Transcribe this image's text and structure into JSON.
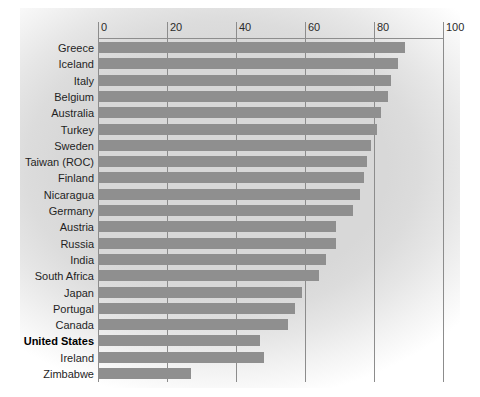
{
  "chart_data": {
    "type": "bar",
    "orientation": "horizontal",
    "title": "",
    "xlabel": "",
    "ylabel": "",
    "xlim": [
      0,
      100
    ],
    "grid": true,
    "legend": null,
    "tick_labels": [
      "0",
      "20",
      "40",
      "60",
      "80",
      "100"
    ],
    "ticks": [
      0,
      20,
      40,
      60,
      80,
      100
    ],
    "categories": [
      "Greece",
      "Iceland",
      "Italy",
      "Belgium",
      "Australia",
      "Turkey",
      "Sweden",
      "Taiwan (ROC)",
      "Finland",
      "Nicaragua",
      "Germany",
      "Austria",
      "Russia",
      "India",
      "South Africa",
      "Japan",
      "Portugal",
      "Canada",
      "United States",
      "Ireland",
      "Zimbabwe"
    ],
    "values": [
      89,
      87,
      85,
      84,
      82,
      81,
      79,
      78,
      77,
      76,
      74,
      69,
      69,
      66,
      64,
      59,
      57,
      55,
      47,
      48,
      27
    ],
    "highlight_category": "United States",
    "bar_color": "#8f8f8f",
    "gridline_color": "#8c8c8c",
    "background_color": "#d8d8d8"
  },
  "rows": [
    {
      "label": "Greece",
      "value": 89,
      "bold": false
    },
    {
      "label": "Iceland",
      "value": 87,
      "bold": false
    },
    {
      "label": "Italy",
      "value": 85,
      "bold": false
    },
    {
      "label": "Belgium",
      "value": 84,
      "bold": false
    },
    {
      "label": "Australia",
      "value": 82,
      "bold": false
    },
    {
      "label": "Turkey",
      "value": 81,
      "bold": false
    },
    {
      "label": "Sweden",
      "value": 79,
      "bold": false
    },
    {
      "label": "Taiwan (ROC)",
      "value": 78,
      "bold": false
    },
    {
      "label": "Finland",
      "value": 77,
      "bold": false
    },
    {
      "label": "Nicaragua",
      "value": 76,
      "bold": false
    },
    {
      "label": "Germany",
      "value": 74,
      "bold": false
    },
    {
      "label": "Austria",
      "value": 69,
      "bold": false
    },
    {
      "label": "Russia",
      "value": 69,
      "bold": false
    },
    {
      "label": "India",
      "value": 66,
      "bold": false
    },
    {
      "label": "South Africa",
      "value": 64,
      "bold": false
    },
    {
      "label": "Japan",
      "value": 59,
      "bold": false
    },
    {
      "label": "Portugal",
      "value": 57,
      "bold": false
    },
    {
      "label": "Canada",
      "value": 55,
      "bold": false
    },
    {
      "label": "United States",
      "value": 47,
      "bold": true
    },
    {
      "label": "Ireland",
      "value": 48,
      "bold": false
    },
    {
      "label": "Zimbabwe",
      "value": 27,
      "bold": false
    }
  ]
}
